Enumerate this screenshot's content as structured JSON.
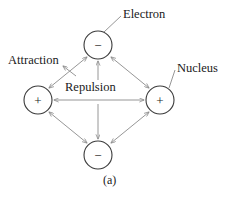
{
  "figure": {
    "caption": "(a)",
    "labels": {
      "electron": "Electron",
      "nucleus": "Nucleus",
      "attraction": "Attraction",
      "repulsion": "Repulsion"
    },
    "nodes": [
      {
        "id": "top",
        "charge": "−",
        "role": "electron",
        "cx": 98,
        "cy": 45,
        "r": 14
      },
      {
        "id": "left",
        "charge": "+",
        "role": "nucleus",
        "cx": 38,
        "cy": 100,
        "r": 14
      },
      {
        "id": "right",
        "charge": "+",
        "role": "nucleus",
        "cx": 160,
        "cy": 100,
        "r": 14
      },
      {
        "id": "bottom",
        "charge": "−",
        "role": "electron",
        "cx": 98,
        "cy": 155,
        "r": 14
      }
    ],
    "interactions": [
      {
        "from": "left",
        "to": "top",
        "kind": "attraction",
        "arrows": "double"
      },
      {
        "from": "right",
        "to": "top",
        "kind": "attraction",
        "arrows": "double"
      },
      {
        "from": "left",
        "to": "bottom",
        "kind": "attraction",
        "arrows": "double"
      },
      {
        "from": "right",
        "to": "bottom",
        "kind": "attraction",
        "arrows": "double"
      },
      {
        "from": "left",
        "to": "right",
        "kind": "repulsion",
        "arrows": "double"
      },
      {
        "from": "top",
        "to": "bottom",
        "kind": "repulsion",
        "arrows": "double"
      }
    ],
    "colors": {
      "ink": "#1a1a1a",
      "line": "#8a8a8a",
      "circle_stroke": "#3a3a3a",
      "background": "#ffffff"
    }
  }
}
